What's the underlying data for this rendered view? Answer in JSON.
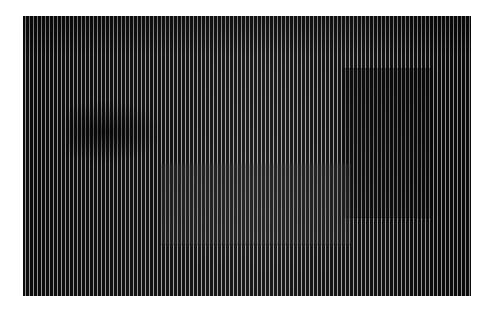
{
  "image": {
    "description": "Photograph of an op-art style artwork made of fine vertical black and light-grey stripes with subtle darker and lighter rectangular regions",
    "colors": {
      "background": "#ffffff",
      "stripe_dark": "#1c1c1c",
      "stripe_light": "#b8b8b8",
      "mid_tone": "#7a7a7a"
    },
    "regions": [
      {
        "name": "left-dark-patch"
      },
      {
        "name": "right-dark-rectangle"
      },
      {
        "name": "center-grey-rectangle"
      }
    ]
  }
}
